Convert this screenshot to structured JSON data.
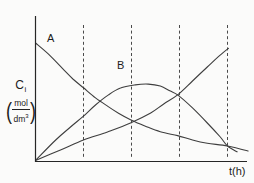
{
  "labels": {
    "curve_a": "A",
    "curve_b": "B",
    "y_symbol": "C",
    "y_subscript": "i",
    "unit_open_paren": "(",
    "unit_numerator": "mol",
    "unit_denominator": "dm",
    "unit_exponent": "3",
    "unit_close_paren": ")",
    "x_label": "t(h)"
  },
  "colors": {
    "curve": "#3e3e3e",
    "axis": "#262626",
    "gridline": "#4a4a4a",
    "background": "#fbfbfa",
    "text": "#1a1a1a"
  },
  "chart_data": {
    "type": "line",
    "title": "",
    "xlabel": "t(h)",
    "ylabel": "Ci (mol/dm3)",
    "xlim": [
      0,
      4.6
    ],
    "ylim": [
      0,
      1.2
    ],
    "grid": "vertical-dashed",
    "legend_position": "none",
    "gridlines_t": [
      1,
      2,
      3,
      4
    ],
    "series": [
      {
        "id": "A",
        "label": "A",
        "description": "reactant concentration, exponential-like decay",
        "points": [
          [
            0,
            1.0
          ],
          [
            0.27,
            0.905
          ],
          [
            0.56,
            0.785
          ],
          [
            0.78,
            0.695
          ],
          [
            1.0,
            0.62
          ],
          [
            1.25,
            0.535
          ],
          [
            1.5,
            0.465
          ],
          [
            1.73,
            0.405
          ],
          [
            1.98,
            0.35
          ],
          [
            2.29,
            0.295
          ],
          [
            2.6,
            0.248
          ],
          [
            2.96,
            0.215
          ],
          [
            3.27,
            0.178
          ],
          [
            3.58,
            0.15
          ],
          [
            4.0,
            0.127
          ],
          [
            4.43,
            0.085
          ]
        ]
      },
      {
        "id": "B",
        "label": "B",
        "description": "intermediate concentration, rises to flat peak then falls, crosses A at t=4",
        "points": [
          [
            0,
            0.005
          ],
          [
            0.42,
            0.178
          ],
          [
            0.73,
            0.288
          ],
          [
            1.0,
            0.38
          ],
          [
            1.25,
            0.475
          ],
          [
            1.52,
            0.56
          ],
          [
            1.77,
            0.618
          ],
          [
            2.08,
            0.645
          ],
          [
            2.35,
            0.652
          ],
          [
            2.6,
            0.635
          ],
          [
            2.81,
            0.592
          ],
          [
            2.96,
            0.56
          ],
          [
            3.27,
            0.45
          ],
          [
            3.58,
            0.322
          ],
          [
            3.85,
            0.203
          ],
          [
            4.0,
            0.127
          ],
          [
            4.2,
            0.078
          ]
        ]
      },
      {
        "id": "C",
        "label": "",
        "description": "unlabeled product concentration, accelerating rise; crosses A near t=2 and B at t=3, ends at t=4 gridline",
        "points": [
          [
            0,
            0.005
          ],
          [
            0.52,
            0.093
          ],
          [
            1.0,
            0.178
          ],
          [
            1.5,
            0.246
          ],
          [
            1.98,
            0.322
          ],
          [
            2.4,
            0.407
          ],
          [
            2.67,
            0.483
          ],
          [
            2.96,
            0.56
          ],
          [
            3.27,
            0.678
          ],
          [
            3.58,
            0.797
          ],
          [
            3.81,
            0.885
          ],
          [
            4.02,
            0.955
          ]
        ]
      }
    ]
  }
}
